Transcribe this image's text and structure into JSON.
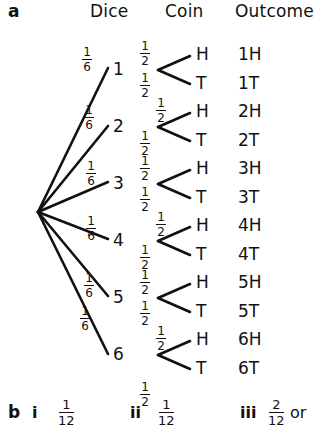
{
  "figure": {
    "part_a_letter": "a",
    "part_b_letter": "b",
    "headers": {
      "dice": "Dice",
      "coin": "Coin",
      "outcome": "Outcome"
    },
    "root": {
      "x": 38,
      "y": 212
    },
    "dice_branches": [
      {
        "label": "1",
        "probability_num": "1",
        "probability_den": "6",
        "x": 118,
        "y": 70
      },
      {
        "label": "2",
        "probability_num": "1",
        "probability_den": "6",
        "x": 118,
        "y": 127
      },
      {
        "label": "3",
        "probability_num": "1",
        "probability_den": "6",
        "x": 118,
        "y": 183
      },
      {
        "label": "4",
        "probability_num": "1",
        "probability_den": "6",
        "x": 118,
        "y": 240
      },
      {
        "label": "5",
        "probability_num": "1",
        "probability_den": "6",
        "x": 118,
        "y": 297
      },
      {
        "label": "6",
        "probability_num": "1",
        "probability_den": "6",
        "x": 118,
        "y": 355
      }
    ],
    "coin_labels": {
      "heads": "H",
      "tails": "T"
    },
    "coin_probability": {
      "num": "1",
      "den": "2"
    },
    "outcomes": [
      "1H",
      "1T",
      "2H",
      "2T",
      "3H",
      "3T",
      "4H",
      "4T",
      "5H",
      "5T",
      "6H",
      "6T"
    ],
    "answers": [
      {
        "numeral": "i",
        "num": "1",
        "den": "12"
      },
      {
        "numeral": "ii",
        "num": "1",
        "den": "12"
      },
      {
        "numeral": "iii",
        "num": "2",
        "den": "12",
        "suffix": "or"
      }
    ]
  }
}
